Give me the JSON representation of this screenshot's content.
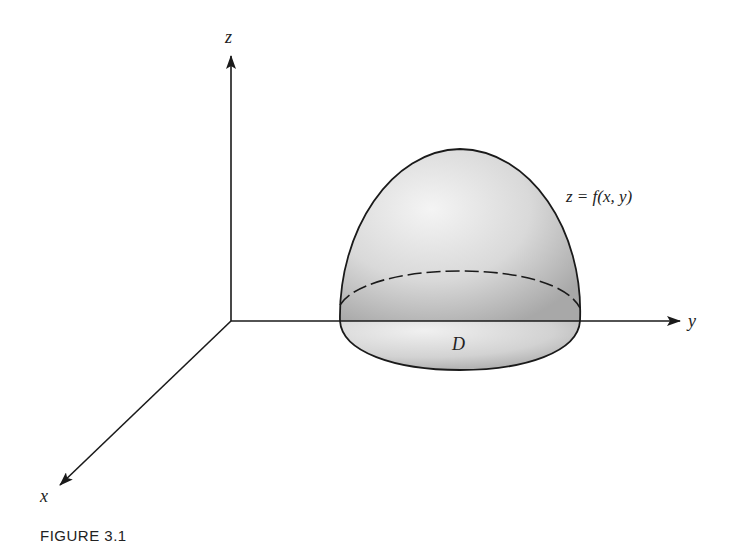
{
  "figure": {
    "caption": "FIGURE 3.1",
    "axes": {
      "z_label": "z",
      "y_label": "y",
      "x_label": "x"
    },
    "surface": {
      "equation_label": "z = f(x, y)",
      "region_label": "D"
    },
    "colors": {
      "stroke": "#1a1a1a",
      "surface_light": "#f2f2f2",
      "surface_dark": "#b5b5b5",
      "text": "#222222"
    }
  }
}
